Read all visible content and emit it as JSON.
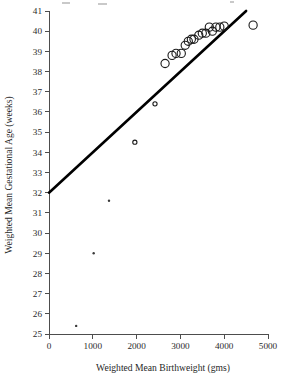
{
  "figure": {
    "background_color": "#ffffff",
    "ink_color": "#1a1a1a",
    "axis_color": "#4d4d4d"
  },
  "chart_data": {
    "type": "scatter",
    "title": "",
    "xlabel": "Weighted Mean Birthweight (gms)",
    "ylabel": "Weighted Mean Gestational Age (weeks)",
    "xlim": [
      0,
      5000
    ],
    "ylim": [
      25,
      41
    ],
    "xticks": [
      0,
      1000,
      2000,
      3000,
      4000,
      5000
    ],
    "yticks": [
      25,
      26,
      27,
      28,
      29,
      30,
      31,
      32,
      33,
      34,
      35,
      36,
      37,
      38,
      39,
      40,
      41
    ],
    "xtick_labels": [
      "0",
      "1000",
      "2000",
      "3000",
      "4000",
      "5000"
    ],
    "ytick_labels": [
      "25",
      "26",
      "27",
      "28",
      "29",
      "30",
      "31",
      "32",
      "33",
      "34",
      "35",
      "36",
      "37",
      "38",
      "39",
      "40",
      "41"
    ],
    "grid": false,
    "legend": null,
    "points": [
      {
        "x": 620,
        "y": 25.4,
        "marker": "small-dot"
      },
      {
        "x": 1020,
        "y": 29.0,
        "marker": "small-dot"
      },
      {
        "x": 1370,
        "y": 31.6,
        "marker": "small-dot"
      },
      {
        "x": 1960,
        "y": 34.5,
        "marker": "small-circle"
      },
      {
        "x": 2420,
        "y": 36.4,
        "marker": "small-circle"
      },
      {
        "x": 2650,
        "y": 38.4,
        "marker": "open-circle"
      },
      {
        "x": 2810,
        "y": 38.8,
        "marker": "open-circle"
      },
      {
        "x": 2900,
        "y": 38.9,
        "marker": "open-circle"
      },
      {
        "x": 3020,
        "y": 38.9,
        "marker": "open-circle"
      },
      {
        "x": 3110,
        "y": 39.3,
        "marker": "open-circle"
      },
      {
        "x": 3180,
        "y": 39.5,
        "marker": "open-circle"
      },
      {
        "x": 3250,
        "y": 39.6,
        "marker": "open-circle"
      },
      {
        "x": 3310,
        "y": 39.6,
        "marker": "open-circle"
      },
      {
        "x": 3420,
        "y": 39.8,
        "marker": "open-circle"
      },
      {
        "x": 3500,
        "y": 39.9,
        "marker": "open-circle"
      },
      {
        "x": 3580,
        "y": 39.9,
        "marker": "open-circle"
      },
      {
        "x": 3660,
        "y": 40.2,
        "marker": "open-circle"
      },
      {
        "x": 3730,
        "y": 40.0,
        "marker": "open-circle"
      },
      {
        "x": 3810,
        "y": 40.2,
        "marker": "open-circle"
      },
      {
        "x": 3900,
        "y": 40.2,
        "marker": "open-circle"
      },
      {
        "x": 4000,
        "y": 40.25,
        "marker": "open-circle"
      },
      {
        "x": 4660,
        "y": 40.3,
        "marker": "open-circle"
      }
    ],
    "fit_line": {
      "label": "regression-line",
      "x_start": 0,
      "y_start": 32.0,
      "x_end": 4500,
      "y_end": 41.0
    }
  }
}
